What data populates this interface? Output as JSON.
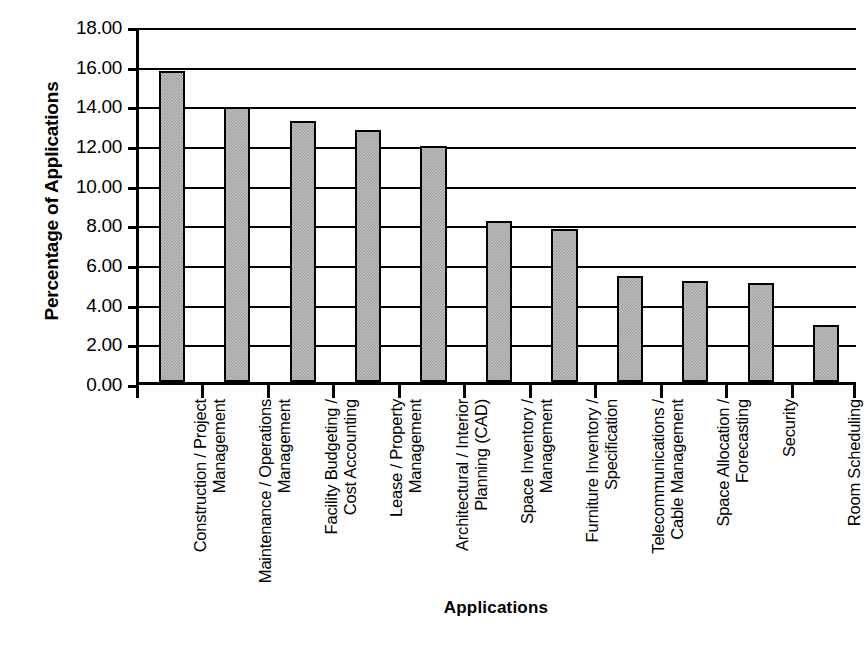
{
  "chart_data": {
    "type": "bar",
    "title": "",
    "xlabel": "Applications",
    "ylabel": "Percentage of Applications",
    "ylim": [
      0,
      18
    ],
    "ytick_step": 2,
    "grid": true,
    "legend": "none",
    "bar_color": "#bfbfbf",
    "bar_border_color": "#000000",
    "axis_color": "#000000",
    "ytick_labels": [
      "0.00",
      "2.00",
      "4.00",
      "6.00",
      "8.00",
      "10.00",
      "12.00",
      "14.00",
      "16.00",
      "18.00"
    ],
    "ytick_values": [
      0,
      2,
      4,
      6,
      8,
      10,
      12,
      14,
      16,
      18
    ],
    "categories": [
      "Construction / Project\nManagement",
      "Maintenance / Operations\nManagement",
      "Facility Budgeting /\nCost Accounting",
      "Lease / Property\nManagement",
      "Architectural / Interior\nPlanning (CAD)",
      "Space Inventory /\nManagement",
      "Furniture Inventory /\nSpecification",
      "Telecommunications /\nCable Management",
      "Space Allocation /\nForecasting",
      "Security",
      "Room Scheduling"
    ],
    "values": [
      15.7,
      13.85,
      13.15,
      12.7,
      11.9,
      8.1,
      7.7,
      5.35,
      5.1,
      5.0,
      2.85
    ]
  }
}
